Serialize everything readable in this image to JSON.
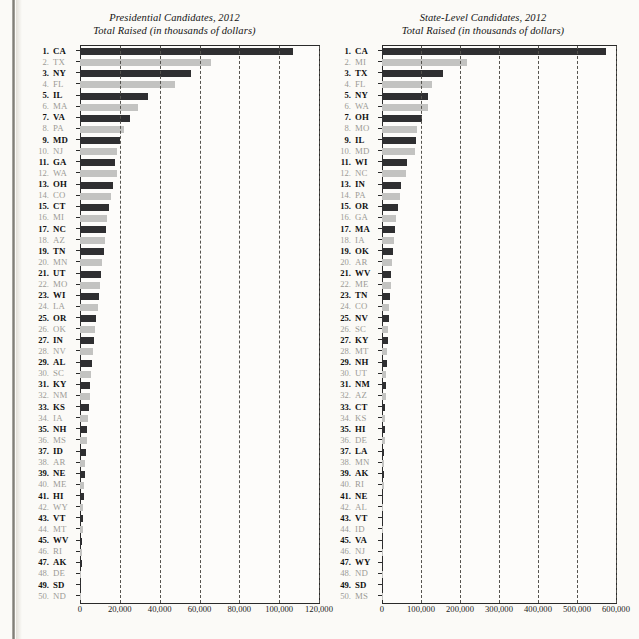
{
  "page": {
    "background_color": "#fbfaf7",
    "ink_color": "#1b1b1b",
    "bar_dark_color": "#2f2f31",
    "bar_light_color": "#c3c3c1"
  },
  "chart_data": [
    {
      "type": "bar",
      "orientation": "horizontal",
      "panel": "left",
      "title": "Presidential Candidates, 2012",
      "subtitle": "Total Raised (in thousands of dollars)",
      "xlabel": "",
      "ylabel": "",
      "xlim": [
        0,
        120000
      ],
      "xticks": [
        0,
        20000,
        40000,
        60000,
        80000,
        100000,
        120000
      ],
      "xticklabels": [
        "0",
        "20,000",
        "40,000",
        "60,000",
        "80,000",
        "100,000",
        "120,000"
      ],
      "grid": true,
      "grid_style": "dashed-vertical",
      "legend": "none",
      "ranks": [
        1,
        2,
        3,
        4,
        5,
        6,
        7,
        8,
        9,
        10,
        11,
        12,
        13,
        14,
        15,
        16,
        17,
        18,
        19,
        20,
        21,
        22,
        23,
        24,
        25,
        26,
        27,
        28,
        29,
        30,
        31,
        32,
        33,
        34,
        35,
        36,
        37,
        38,
        39,
        40,
        41,
        42,
        43,
        44,
        45,
        46,
        47,
        48,
        49,
        50
      ],
      "categories": [
        "CA",
        "TX",
        "NY",
        "FL",
        "IL",
        "MA",
        "VA",
        "PA",
        "MD",
        "NJ",
        "GA",
        "WA",
        "OH",
        "CO",
        "CT",
        "MI",
        "NC",
        "AZ",
        "TN",
        "MN",
        "UT",
        "MO",
        "WI",
        "LA",
        "OR",
        "OK",
        "IN",
        "NV",
        "AL",
        "SC",
        "KY",
        "NM",
        "KS",
        "IA",
        "NH",
        "MS",
        "ID",
        "AR",
        "NE",
        "ME",
        "HI",
        "WY",
        "VT",
        "MT",
        "WV",
        "RI",
        "AK",
        "DE",
        "SD",
        "ND"
      ],
      "values": [
        107000,
        66000,
        55500,
        47500,
        34000,
        29000,
        25200,
        22100,
        20200,
        18600,
        17800,
        18500,
        16600,
        15600,
        14500,
        13800,
        13200,
        12600,
        11800,
        11200,
        10600,
        10200,
        9600,
        8800,
        8200,
        7600,
        7100,
        6600,
        6100,
        5700,
        5200,
        4800,
        4400,
        4000,
        3600,
        3300,
        3000,
        2700,
        2400,
        2100,
        1900,
        1700,
        1500,
        1300,
        1150,
        1000,
        850,
        700,
        500,
        320
      ]
    },
    {
      "type": "bar",
      "orientation": "horizontal",
      "panel": "right",
      "title": "State-Level Candidates, 2012",
      "subtitle": "Total Raised (in thousands of dollars)",
      "xlabel": "",
      "ylabel": "",
      "xlim": [
        0,
        600000
      ],
      "xticks": [
        0,
        100000,
        200000,
        300000,
        400000,
        500000,
        600000
      ],
      "xticklabels": [
        "0",
        "100,000",
        "200,000",
        "300,000",
        "400,000",
        "500,000",
        "600,000"
      ],
      "grid": true,
      "grid_style": "dashed-vertical",
      "legend": "none",
      "ranks": [
        1,
        2,
        3,
        4,
        5,
        6,
        7,
        8,
        9,
        10,
        11,
        12,
        13,
        14,
        15,
        16,
        17,
        18,
        19,
        20,
        21,
        22,
        23,
        24,
        25,
        26,
        27,
        28,
        29,
        30,
        31,
        32,
        33,
        34,
        35,
        36,
        37,
        38,
        39,
        40,
        41,
        42,
        43,
        44,
        45,
        46,
        47,
        48,
        49,
        50
      ],
      "categories": [
        "CA",
        "MI",
        "TX",
        "FL",
        "NY",
        "WA",
        "OH",
        "MO",
        "IL",
        "MD",
        "WI",
        "NC",
        "IN",
        "PA",
        "OR",
        "GA",
        "MA",
        "IA",
        "OK",
        "AR",
        "WV",
        "ME",
        "TN",
        "CO",
        "NV",
        "SC",
        "KY",
        "MT",
        "NH",
        "UT",
        "NM",
        "AZ",
        "CT",
        "KS",
        "HI",
        "DE",
        "LA",
        "MN",
        "AK",
        "RI",
        "NE",
        "AL",
        "VT",
        "ID",
        "VA",
        "NJ",
        "WY",
        "ND",
        "SD",
        "MS"
      ],
      "values": [
        575000,
        218000,
        157000,
        128000,
        119000,
        118000,
        103000,
        90000,
        87000,
        85000,
        64000,
        62000,
        49000,
        45000,
        41000,
        37000,
        34000,
        31000,
        28000,
        26000,
        24000,
        22000,
        20500,
        19000,
        17500,
        16000,
        14500,
        13500,
        12500,
        11500,
        10500,
        9500,
        8800,
        8000,
        7200,
        6500,
        5900,
        5300,
        4700,
        4200,
        3700,
        3200,
        2800,
        2400,
        2000,
        1700,
        1400,
        1100,
        800,
        520
      ]
    }
  ]
}
